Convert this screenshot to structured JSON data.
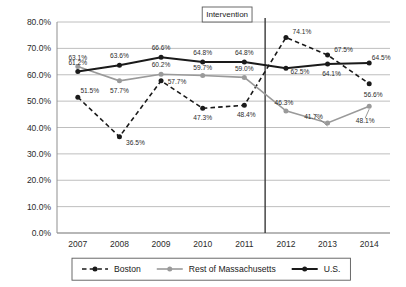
{
  "chart_data": {
    "type": "line",
    "title": "",
    "xlabel": "",
    "ylabel": "",
    "categories": [
      "2007",
      "2008",
      "2009",
      "2010",
      "2011",
      "2012",
      "2013",
      "2014"
    ],
    "ylim": [
      0,
      80
    ],
    "ytick_labels": [
      "0.0%",
      "10.0%",
      "20.0%",
      "30.0%",
      "40.0%",
      "50.0%",
      "60.0%",
      "70.0%",
      "80.0%"
    ],
    "ytick_values": [
      0,
      10,
      20,
      30,
      40,
      50,
      60,
      70,
      80
    ],
    "grid": true,
    "legend_position": "bottom",
    "series": [
      {
        "name": "Boston",
        "style": "dashed",
        "color": "#1a1a1a",
        "marker": "circle",
        "values": [
          51.5,
          36.5,
          57.7,
          47.3,
          48.4,
          74.1,
          67.5,
          56.6
        ],
        "labels": [
          "51.5%",
          "36.5%",
          "57.7%",
          "47.3%",
          "48.4%",
          "74.1%",
          "67.5%",
          "56.6%"
        ]
      },
      {
        "name": "Rest of Massachusetts",
        "style": "solid",
        "color": "#9a9a9a",
        "marker": "circle",
        "values": [
          63.1,
          57.7,
          60.2,
          59.7,
          59.0,
          46.3,
          41.7,
          48.1
        ],
        "labels": [
          "63.1%",
          "57.7%",
          "60.2%",
          "59.7%",
          "59.0%",
          "46.3%",
          "41.7%",
          "48.1%"
        ]
      },
      {
        "name": "U.S.",
        "style": "solid-thick",
        "color": "#1a1a1a",
        "marker": "circle",
        "values": [
          61.2,
          63.6,
          66.6,
          64.8,
          64.8,
          62.5,
          64.1,
          64.5
        ],
        "labels": [
          "61.2%",
          "63.6%",
          "66.6%",
          "64.8%",
          "64.8%",
          "62.5%",
          "64.1%",
          "64.5%"
        ]
      }
    ],
    "annotations": [
      {
        "name": "intervention",
        "text": "Intervention",
        "type": "vertical-line-with-box",
        "x_position": "between 2011 and 2012"
      }
    ]
  },
  "colors": {
    "gridline": "#b7b7b7",
    "axis": "#8f8f8f",
    "boston": "#1a1a1a",
    "rest_of_ma": "#9a9a9a",
    "us": "#1a1a1a",
    "background": "#ffffff"
  }
}
